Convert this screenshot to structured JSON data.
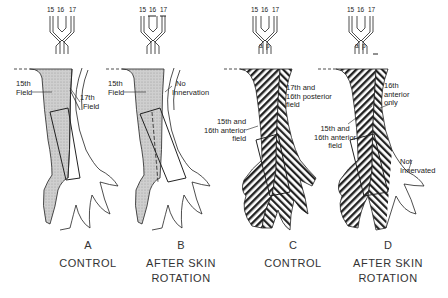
{
  "figure": {
    "panels": [
      {
        "id": "A",
        "letter": "A",
        "caption_line1": "CONTROL",
        "caption_line2": "",
        "nerves": [
          "15",
          "16",
          "17"
        ],
        "labels": [
          "15th\nField",
          "17th\nField"
        ],
        "label_lines": {
          "l1a": "15th",
          "l1b": "Field",
          "l2a": "17th",
          "l2b": "Field"
        },
        "pattern": "stipple"
      },
      {
        "id": "B",
        "letter": "B",
        "caption_line1": "AFTER SKIN",
        "caption_line2": "ROTATION",
        "nerves": [
          "15",
          "16",
          "17"
        ],
        "label_lines": {
          "l1a": "15th",
          "l1b": "Field",
          "l2a": "No",
          "l2b": "Innervation"
        },
        "pattern": "stipple"
      },
      {
        "id": "C",
        "letter": "C",
        "caption_line1": "CONTROL",
        "caption_line2": "",
        "nerves": [
          "15",
          "16",
          "17"
        ],
        "branch_labels": [
          "a",
          "p"
        ],
        "label_lines": {
          "l1a": "17th and",
          "l1b": "16th posterior",
          "l1c": "field",
          "l2a": "15th and",
          "l2b": "16th anterior",
          "l2c": "field"
        },
        "pattern": "hatch"
      },
      {
        "id": "D",
        "letter": "D",
        "caption_line1": "AFTER SKIN",
        "caption_line2": "ROTATION",
        "nerves": [
          "15",
          "16",
          "17"
        ],
        "branch_labels": [
          "a",
          "p"
        ],
        "label_lines": {
          "l1a": "16th",
          "l1b": "anterior",
          "l1c": "only",
          "l2a": "15th and",
          "l2b": "16th anterior",
          "l2c": "field",
          "l3a": "Not",
          "l3b": "Innervated"
        },
        "pattern": "hatch"
      }
    ],
    "colors": {
      "ink": "#222222",
      "stipple_fill": "#c8c8c8",
      "background": "#ffffff"
    }
  }
}
